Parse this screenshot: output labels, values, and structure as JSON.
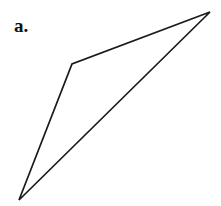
{
  "canvas": {
    "width": 221,
    "height": 206,
    "background_color": "#ffffff"
  },
  "figure": {
    "label": "a.",
    "label_position": {
      "x": 14,
      "y": 16
    },
    "shape_type": "closed-polygon",
    "shape_name": "quadrilateral",
    "stroke_color": "#1a1a1a",
    "stroke_width": 1.7,
    "fill": "none",
    "vertices": [
      {
        "name": "apex-top-right",
        "x": 210,
        "y": 12
      },
      {
        "name": "bend-upper-left",
        "x": 72,
        "y": 64
      },
      {
        "name": "point-bottom-left",
        "x": 19,
        "y": 200
      }
    ],
    "edges": [
      {
        "name": "upper-edge",
        "from": "apex-top-right",
        "to": "bend-upper-left"
      },
      {
        "name": "left-edge",
        "from": "bend-upper-left",
        "to": "point-bottom-left"
      },
      {
        "name": "long-diagonal-edge",
        "from": "point-bottom-left",
        "to": "apex-top-right"
      }
    ],
    "points_attribute": "210,12 72,64 19,200"
  }
}
